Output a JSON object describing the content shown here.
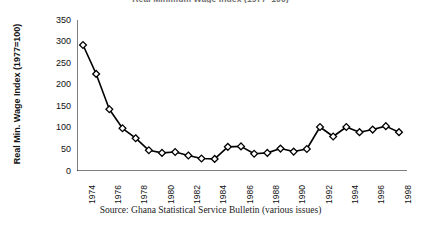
{
  "figure": {
    "clipped_title": "Real Minimum Wage Index (1977=100)",
    "source_note": "Source: Ghana Statistical Service Bulletin (various issues)"
  },
  "chart_data": {
    "type": "line",
    "title": "",
    "xlabel": "",
    "ylabel": "Real Min. Wage Index (1977=100)",
    "ylim": [
      0,
      350
    ],
    "ytick_values": [
      0,
      50,
      100,
      150,
      200,
      250,
      300,
      350
    ],
    "ytick_labels": [
      "0",
      "50",
      "100",
      "150",
      "200",
      "250",
      "300",
      "350"
    ],
    "xlim": [
      1974,
      1998
    ],
    "xtick_labels": [
      "1974",
      "1976",
      "1978",
      "1980",
      "1982",
      "1984",
      "1986",
      "1988",
      "1990",
      "1992",
      "1994",
      "1996",
      "1998"
    ],
    "grid": false,
    "legend": false,
    "marker": "diamond-open",
    "line_color": "#000000",
    "marker_face_color": "#ffffff",
    "x": [
      1974,
      1975,
      1976,
      1977,
      1978,
      1979,
      1980,
      1981,
      1982,
      1983,
      1984,
      1985,
      1986,
      1987,
      1988,
      1989,
      1990,
      1991,
      1992,
      1993,
      1994,
      1995,
      1996,
      1997,
      1998
    ],
    "values": [
      292,
      225,
      143,
      99,
      76,
      48,
      42,
      44,
      36,
      29,
      28,
      56,
      57,
      40,
      42,
      52,
      45,
      51,
      102,
      80,
      102,
      90,
      96,
      104,
      90
    ],
    "categories": [
      "1974",
      "1975",
      "1976",
      "1977",
      "1978",
      "1979",
      "1980",
      "1981",
      "1982",
      "1983",
      "1984",
      "1985",
      "1986",
      "1987",
      "1988",
      "1989",
      "1990",
      "1991",
      "1992",
      "1993",
      "1994",
      "1995",
      "1996",
      "1997",
      "1998"
    ]
  }
}
